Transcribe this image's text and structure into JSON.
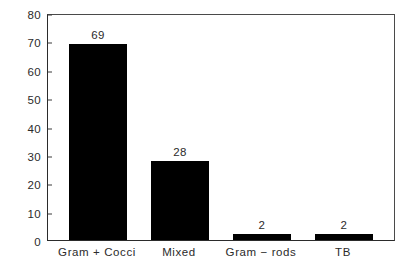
{
  "chart_data": {
    "type": "bar",
    "title": "",
    "subtitle": "",
    "xlabel": "",
    "ylabel": "",
    "categories": [
      "Gram + Cocci",
      "Mixed",
      "Gram − rods",
      "TB"
    ],
    "values": [
      69,
      28,
      2,
      2
    ],
    "value_labels": [
      "69",
      "28",
      "2",
      "2"
    ],
    "ylim": [
      0,
      80
    ],
    "ytick_labels": [
      "0",
      "10",
      "20",
      "30",
      "40",
      "50",
      "60",
      "70",
      "80"
    ],
    "ytick_values": [
      0,
      10,
      20,
      30,
      40,
      50,
      60,
      70,
      80
    ],
    "grid": false,
    "legend": false,
    "legend_position": "none",
    "bar_color": "#000000",
    "axis_color": "#2b2b2b",
    "text_color": "#2b2b2b",
    "background_color": "#ffffff"
  }
}
